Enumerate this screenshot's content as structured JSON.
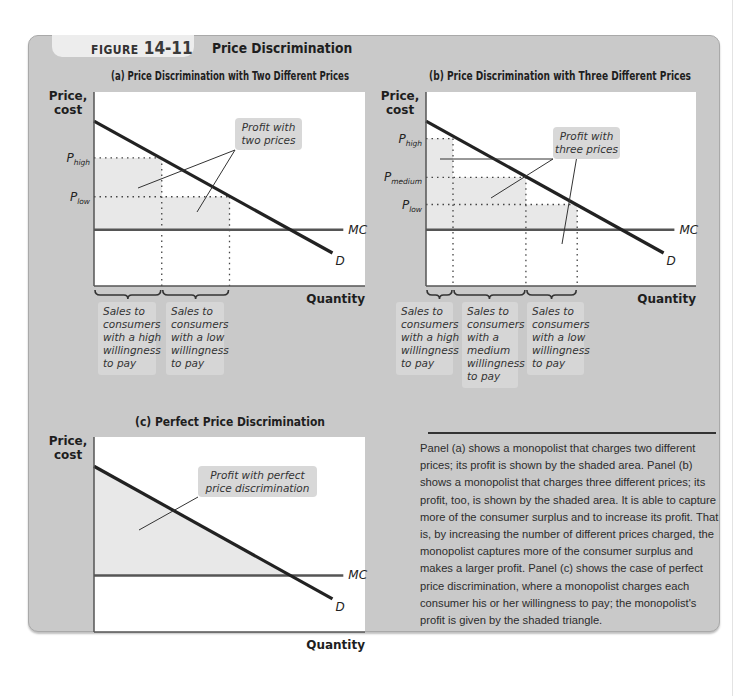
{
  "figure": {
    "label_word": "FIGURE",
    "label_number": "14-11",
    "title": "Price Discrimination"
  },
  "caption": "Panel (a) shows a monopolist that charges two different prices; its profit is shown by the shaded area. Panel (b) shows a monopolist that charges three different prices; its profit, too, is shown by the shaded area. It is able to capture more of the consumer surplus and to increase its profit. That is, by increasing the number of different prices charged, the monopolist captures more of the consumer surplus and makes a larger profit. Panel (c) shows the case of perfect price discrimination, where a monopolist charges each consumer his or her willingness to pay; the monopolist's profit is given by the shaded triangle.",
  "colors": {
    "frame": "#c9c9c9",
    "plot_bg": "#ffffff",
    "shade": "#e8e8e8",
    "demand": "#222222",
    "mc": "#555555",
    "callout_bg": "#d8d8d8"
  },
  "chart_data": [
    {
      "type": "line",
      "panel": "a",
      "title": "(a) Price Discrimination with Two Different Prices",
      "xlabel": "Quantity",
      "ylabel": "Price, cost",
      "xlim": [
        0,
        10
      ],
      "ylim": [
        0,
        10
      ],
      "grid": false,
      "series": [
        {
          "name": "D",
          "x": [
            0,
            8.8
          ],
          "y": [
            8.5,
            1.7
          ]
        },
        {
          "name": "MC",
          "x": [
            0,
            9.2
          ],
          "y": [
            2.9,
            2.9
          ]
        }
      ],
      "price_levels": [
        {
          "label": "P",
          "sub": "high",
          "y": 6.6
        },
        {
          "label": "P",
          "sub": "low",
          "y": 4.6
        }
      ],
      "quantity_breaks": [
        2.5,
        5.0
      ],
      "shaded_blocks": [
        {
          "x": [
            0,
            2.5
          ],
          "y": [
            2.9,
            6.6
          ]
        },
        {
          "x": [
            2.5,
            5.0
          ],
          "y": [
            2.9,
            4.6
          ]
        }
      ],
      "annotations": {
        "profit_callout": "Profit with two prices",
        "segments": [
          "Sales to consumers with a high willingness to pay",
          "Sales to consumers with a low willingness to pay"
        ]
      }
    },
    {
      "type": "line",
      "panel": "b",
      "title": "(b) Price Discrimination with Three Different Prices",
      "xlabel": "Quantity",
      "ylabel": "Price, cost",
      "xlim": [
        0,
        10
      ],
      "ylim": [
        0,
        10
      ],
      "grid": false,
      "series": [
        {
          "name": "D",
          "x": [
            0,
            8.8
          ],
          "y": [
            8.5,
            1.7
          ]
        },
        {
          "name": "MC",
          "x": [
            0,
            9.2
          ],
          "y": [
            2.9,
            2.9
          ]
        }
      ],
      "price_levels": [
        {
          "label": "P",
          "sub": "high",
          "y": 7.6
        },
        {
          "label": "P",
          "sub": "medium",
          "y": 5.6
        },
        {
          "label": "P",
          "sub": "low",
          "y": 4.2
        }
      ],
      "quantity_breaks": [
        1.0,
        3.7,
        5.6
      ],
      "shaded_blocks": [
        {
          "x": [
            0,
            1.0
          ],
          "y": [
            2.9,
            7.6
          ]
        },
        {
          "x": [
            1.0,
            3.7
          ],
          "y": [
            2.9,
            5.6
          ]
        },
        {
          "x": [
            3.7,
            5.6
          ],
          "y": [
            2.9,
            4.2
          ]
        }
      ],
      "annotations": {
        "profit_callout": "Profit with three prices",
        "segments": [
          "Sales to consumers with a high willingness to pay",
          "Sales to consumers with a medium willingness to pay",
          "Sales to consumers with a low willingness to pay"
        ]
      }
    },
    {
      "type": "area",
      "panel": "c",
      "title": "(c) Perfect Price Discrimination",
      "xlabel": "Quantity",
      "ylabel": "Price, cost",
      "xlim": [
        0,
        10
      ],
      "ylim": [
        0,
        10
      ],
      "grid": false,
      "series": [
        {
          "name": "D",
          "x": [
            0,
            8.8
          ],
          "y": [
            8.5,
            1.7
          ]
        },
        {
          "name": "MC",
          "x": [
            0,
            9.2
          ],
          "y": [
            2.9,
            2.9
          ]
        }
      ],
      "shaded_triangle": {
        "x": [
          0,
          7.25,
          0
        ],
        "y": [
          8.5,
          2.9,
          2.9
        ]
      },
      "annotations": {
        "profit_callout": "Profit with perfect price discrimination"
      }
    }
  ]
}
